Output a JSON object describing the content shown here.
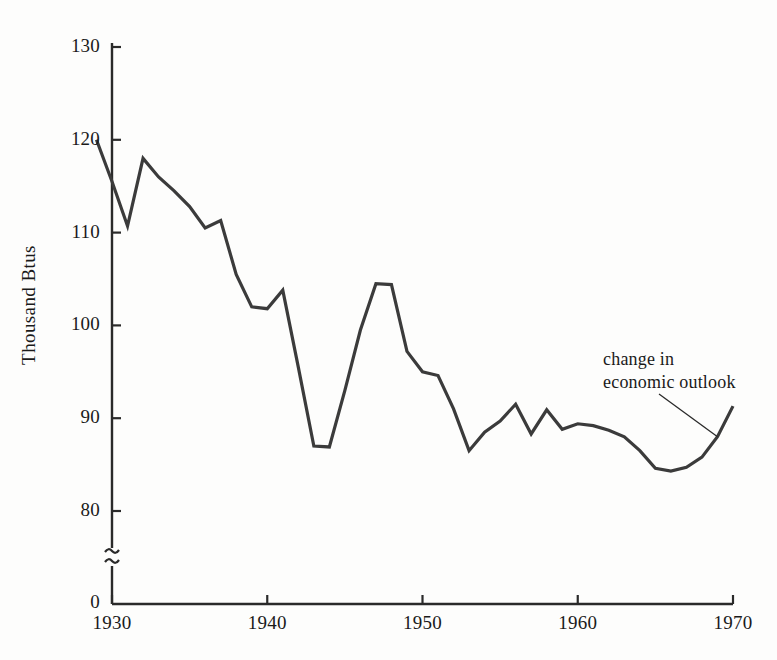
{
  "chart_data": {
    "type": "line",
    "title": "",
    "subtitle": "",
    "xlabel": "",
    "ylabel": "Thousand  Btus",
    "xlim": [
      1928.5,
      1970
    ],
    "ylim": [
      78,
      130
    ],
    "y_axis_break": true,
    "y_axis_break_symbol": "~",
    "y_zero_label": "0",
    "grid": false,
    "legend": null,
    "xticks": [
      1930,
      1940,
      1950,
      1960,
      1970
    ],
    "xtick_labels": [
      "1930",
      "1940",
      "1950",
      "1960",
      "1970"
    ],
    "yticks": [
      80,
      90,
      100,
      110,
      120,
      130
    ],
    "ytick_labels": [
      "80",
      "90",
      "100",
      "110",
      "120",
      "130"
    ],
    "line_color": "#3b3b3b",
    "line_width": 3.2,
    "x": [
      1929,
      1930,
      1931,
      1932,
      1933,
      1934,
      1935,
      1936,
      1937,
      1938,
      1939,
      1940,
      1941,
      1942,
      1943,
      1944,
      1945,
      1946,
      1947,
      1948,
      1949,
      1950,
      1951,
      1952,
      1953,
      1954,
      1955,
      1956,
      1957,
      1958,
      1959,
      1960,
      1961,
      1962,
      1963,
      1964,
      1965,
      1966,
      1967,
      1968,
      1969,
      1970
    ],
    "values": [
      120.0,
      115.5,
      110.7,
      118.0,
      116.0,
      114.5,
      112.8,
      110.5,
      111.3,
      105.5,
      102.0,
      101.8,
      103.8,
      95.5,
      87.0,
      86.9,
      93.0,
      99.5,
      104.5,
      104.4,
      97.2,
      95.0,
      94.6,
      91.0,
      86.5,
      88.5,
      89.7,
      91.5,
      88.3,
      90.9,
      88.8,
      89.4,
      89.2,
      88.7,
      88.0,
      86.5,
      84.6,
      84.3,
      84.7,
      85.8,
      88.0,
      91.3
    ],
    "annotations": [
      {
        "name": "change-in-economic-outlook",
        "text_line1": "change in",
        "text_line2": "economic outlook",
        "points_at_x": 1969,
        "points_at_y": 88.0
      }
    ]
  }
}
